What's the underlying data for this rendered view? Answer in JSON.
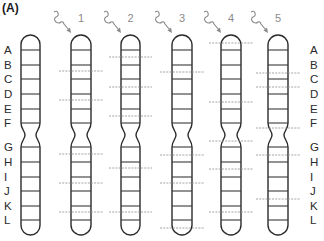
{
  "figure": {
    "panel_label": "(A)",
    "band_labels": [
      "A",
      "B",
      "C",
      "D",
      "E",
      "F",
      "G",
      "H",
      "I",
      "J",
      "K",
      "L"
    ],
    "reference_chromosome": {
      "label_side": "left",
      "x": 21,
      "width": 19
    },
    "right_labels_x": 310,
    "geometry": {
      "top": 35,
      "bottom": 235,
      "centromere_top": 123,
      "centromere_bottom": 147,
      "centromere_pinch_y": 135,
      "band_lines_y": [
        50,
        65,
        79,
        94,
        109,
        123,
        147,
        162,
        177,
        191,
        206,
        220
      ]
    },
    "irradiated_chromosomes": [
      {
        "number": "1",
        "x": 71,
        "width": 20,
        "dashed_breaks_y": [
          71,
          100,
          154,
          183,
          212
        ]
      },
      {
        "number": "2",
        "x": 121,
        "width": 19,
        "dashed_breaks_y": [
          57,
          87,
          116,
          168,
          212
        ]
      },
      {
        "number": "3",
        "x": 172,
        "width": 20,
        "dashed_breaks_y": [
          72,
          155,
          183,
          228
        ]
      },
      {
        "number": "4",
        "x": 221,
        "width": 20,
        "dashed_breaks_y": [
          43,
          102,
          141,
          169,
          212
        ]
      },
      {
        "number": "5",
        "x": 268,
        "width": 20,
        "dashed_breaks_y": [
          73,
          87,
          128,
          155,
          199
        ]
      }
    ],
    "colors": {
      "outline": "#2b2b2b",
      "band": "#3a3a3a",
      "dashed_break": "#9a9a9a",
      "radiation_arrow": "#8a8a8a",
      "chromosome_number": "#8a8a8a"
    },
    "icons": {
      "radiation": "wavy-arrow-icon"
    }
  }
}
